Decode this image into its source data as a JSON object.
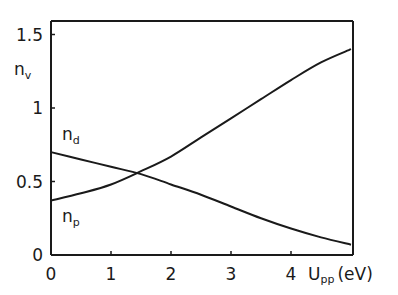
{
  "chart_data": {
    "type": "line",
    "title": "",
    "xlabel": "U_pp (eV)",
    "ylabel": "n_v",
    "xlim": [
      0,
      5
    ],
    "ylim": [
      0,
      1.6
    ],
    "grid": false,
    "legend": "inline labels",
    "x_ticks": [
      "0",
      "1",
      "2",
      "3",
      "4"
    ],
    "y_ticks": [
      "0",
      "0.5",
      "1",
      "1.5"
    ],
    "x": [
      0,
      0.5,
      1,
      1.5,
      2,
      2.5,
      3,
      3.5,
      4,
      4.5,
      5
    ],
    "series": [
      {
        "name": "n_d",
        "values": [
          0.7,
          0.65,
          0.6,
          0.55,
          0.48,
          0.41,
          0.33,
          0.25,
          0.18,
          0.12,
          0.07
        ]
      },
      {
        "name": "n_p",
        "values": [
          0.37,
          0.42,
          0.48,
          0.57,
          0.67,
          0.8,
          0.93,
          1.06,
          1.19,
          1.31,
          1.4
        ]
      }
    ],
    "annotations": [
      "n_d",
      "n_p",
      "n_v",
      "U_pp (eV)"
    ]
  },
  "labels": {
    "y_axis_main": "n",
    "y_axis_sub": "v",
    "x_axis_main": "U",
    "x_axis_sub": "pp",
    "x_axis_unit": "(eV)",
    "nd_main": "n",
    "nd_sub": "d",
    "np_main": "n",
    "np_sub": "p"
  }
}
